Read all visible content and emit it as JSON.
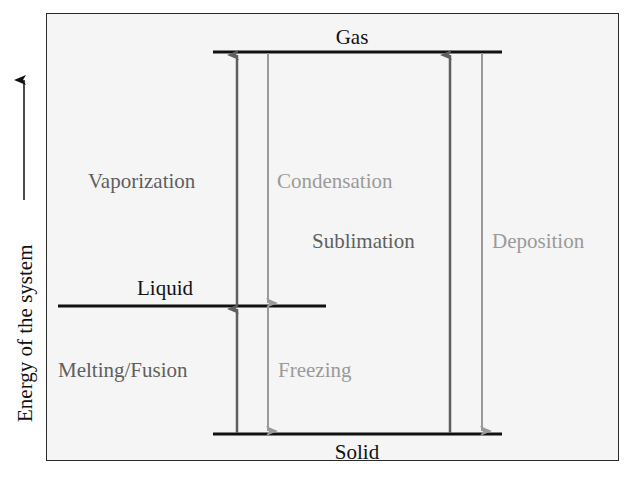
{
  "axis": {
    "label": "Energy of the system",
    "arrow": "up-arrow"
  },
  "levels": {
    "gas": "Gas",
    "liquid": "Liquid",
    "solid": "Solid"
  },
  "transitions": {
    "vaporization": "Vaporization",
    "condensation": "Condensation",
    "sublimation": "Sublimation",
    "deposition": "Deposition",
    "melting": "Melting/Fusion",
    "freezing": "Freezing"
  },
  "colors": {
    "endothermic_arrow": "#5f5f5f",
    "exothermic_arrow": "#9a9a9a",
    "level_line": "#111111"
  }
}
